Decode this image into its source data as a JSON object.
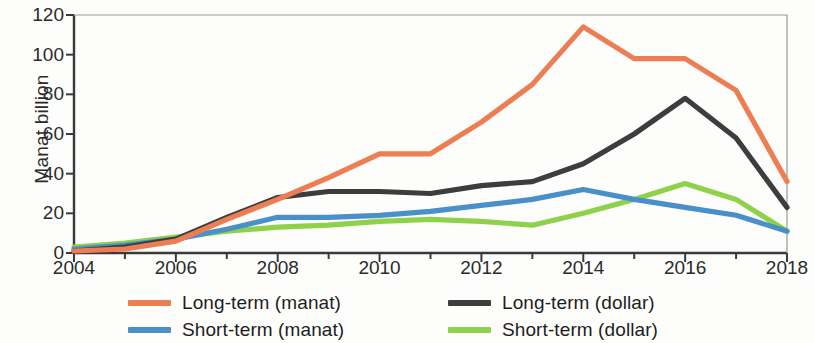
{
  "chart_data": {
    "type": "line",
    "title": "",
    "subtitle": "",
    "xlabel": "",
    "ylabel": "Manat billion",
    "xlim": [
      2004,
      2018
    ],
    "ylim": [
      0,
      120
    ],
    "ytick_labels": [
      "0",
      "20",
      "40",
      "60",
      "80",
      "100",
      "120"
    ],
    "ytick_values": [
      0,
      20,
      40,
      60,
      80,
      100,
      120
    ],
    "xtick_labels": [
      "2004",
      "2006",
      "2008",
      "2010",
      "2012",
      "2014",
      "2016",
      "2018"
    ],
    "xtick_values": [
      2004,
      2006,
      2008,
      2010,
      2012,
      2014,
      2016,
      2018
    ],
    "x_minor_ticks": [
      2005,
      2007,
      2009,
      2011,
      2013,
      2015,
      2017
    ],
    "grid": false,
    "legend_position": "bottom",
    "x": [
      2004,
      2005,
      2006,
      2007,
      2008,
      2009,
      2010,
      2011,
      2012,
      2013,
      2014,
      2015,
      2016,
      2017,
      2018
    ],
    "series": [
      {
        "name": "Long-term (manat)",
        "color": "#ED7D52",
        "values": [
          1,
          2,
          6,
          17,
          27,
          38,
          50,
          50,
          66,
          85,
          114,
          98,
          98,
          82,
          36
        ]
      },
      {
        "name": "Long-term (dollar)",
        "color": "#3D3D3D",
        "values": [
          1,
          3,
          7,
          18,
          28,
          31,
          31,
          30,
          34,
          36,
          45,
          60,
          78,
          58,
          23
        ]
      },
      {
        "name": "Short-term (manat)",
        "color": "#4A90C8",
        "values": [
          2,
          4,
          7,
          12,
          18,
          18,
          19,
          21,
          24,
          27,
          32,
          27,
          23,
          19,
          11
        ]
      },
      {
        "name": "Short-term (dollar)",
        "color": "#8FD14A",
        "values": [
          3,
          5,
          8,
          11,
          13,
          14,
          16,
          17,
          16,
          14,
          20,
          27,
          35,
          27,
          11
        ]
      }
    ]
  },
  "axis": {
    "ylabel": "Manat billion"
  },
  "legend": {
    "items": [
      {
        "label": "Long-term (manat)",
        "color": "#ED7D52"
      },
      {
        "label": "Long-term (dollar)",
        "color": "#3D3D3D"
      },
      {
        "label": "Short-term (manat)",
        "color": "#4A90C8"
      },
      {
        "label": "Short-term (dollar)",
        "color": "#8FD14A"
      }
    ]
  }
}
